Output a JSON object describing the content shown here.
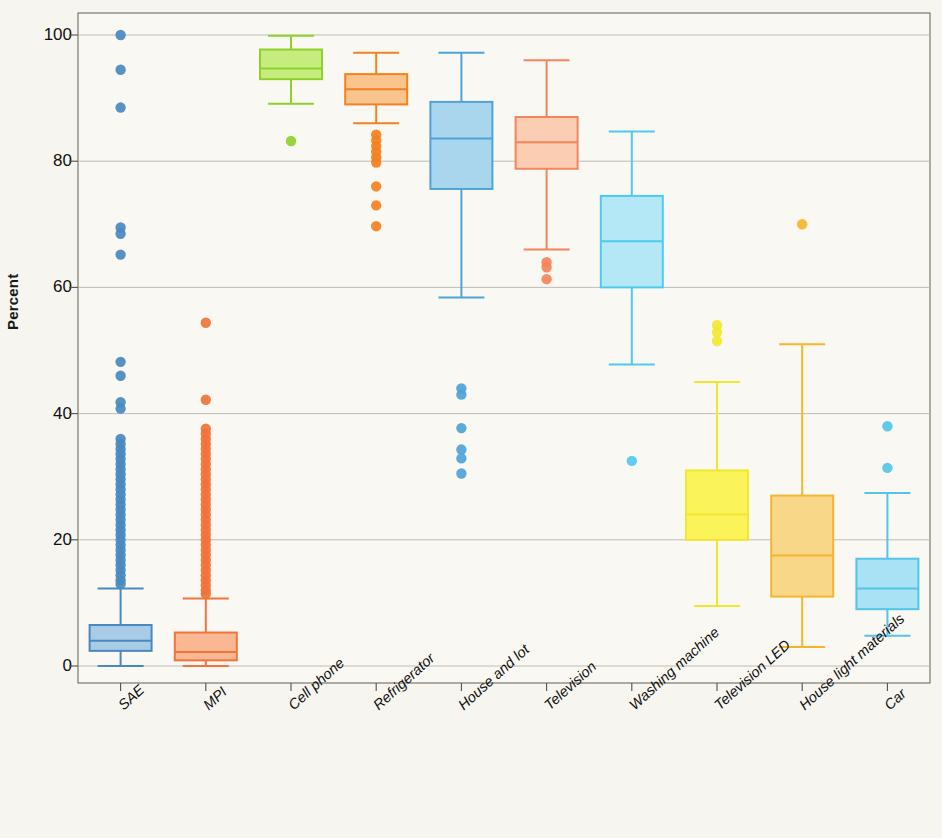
{
  "chart_data": {
    "type": "box",
    "title": "",
    "xlabel": "",
    "ylabel": "Percent",
    "ylim": [
      -6,
      106
    ],
    "yticks": [
      0,
      20,
      40,
      60,
      80,
      100
    ],
    "ytick_labels": [
      "0",
      "20",
      "40",
      "60",
      "80",
      "100"
    ],
    "grid": true,
    "grid_axis": "y",
    "legend": "none",
    "background": "#f6f5f0",
    "plot_background": "#faf8f3",
    "categories": [
      "SAE",
      "MPI",
      "Cell phone",
      "Refrigerator",
      "House and lot",
      "Television",
      "Washing machine",
      "Television LED",
      "House light materials",
      "Car"
    ],
    "boxes": [
      {
        "name": "SAE",
        "color": "#4a89c0",
        "fill": "#a8cbe6",
        "whisker_low": 0.0,
        "q1": 2.4,
        "median": 4.0,
        "q3": 6.5,
        "whisker_high": 12.3,
        "outliers": [
          100.0,
          94.5,
          88.5,
          69.5,
          68.5,
          65.2,
          48.2,
          46.0,
          41.8,
          40.8,
          36.0,
          35.2,
          34.4,
          33.6,
          32.8,
          32.0,
          31.2,
          30.4,
          29.6,
          28.8,
          28.0,
          27.2,
          26.4,
          25.6,
          24.8,
          24.0,
          23.2,
          22.4,
          21.6,
          20.8,
          20.0,
          19.2,
          18.4,
          17.6,
          16.8,
          16.0,
          15.2,
          14.4,
          13.6,
          13.0
        ]
      },
      {
        "name": "MPI",
        "color": "#f0743c",
        "fill": "#f9b893",
        "whisker_low": 0.0,
        "q1": 0.9,
        "median": 2.2,
        "q3": 5.3,
        "whisker_high": 10.7,
        "outliers": [
          54.4,
          42.2,
          37.6,
          36.8,
          36.0,
          35.2,
          34.4,
          33.6,
          32.8,
          32.0,
          31.2,
          30.4,
          29.6,
          28.8,
          28.0,
          27.2,
          26.4,
          25.6,
          24.8,
          24.0,
          23.2,
          22.4,
          21.6,
          20.8,
          20.0,
          19.2,
          18.4,
          17.6,
          16.8,
          16.0,
          15.2,
          14.4,
          13.6,
          12.8,
          12.0,
          11.4
        ]
      },
      {
        "name": "Cell phone",
        "color": "#8cd22a",
        "fill": "#c6ec7e",
        "whisker_low": 89.1,
        "q1": 93.0,
        "median": 94.7,
        "q3": 97.7,
        "whisker_high": 99.9,
        "outliers": [
          83.2
        ]
      },
      {
        "name": "Refrigerator",
        "color": "#f4801f",
        "fill": "#fac48e",
        "whisker_low": 86.0,
        "q1": 89.0,
        "median": 91.4,
        "q3": 93.8,
        "whisker_high": 97.2,
        "outliers": [
          84.2,
          83.3,
          82.4,
          81.5,
          80.6,
          79.8,
          76.0,
          73.0,
          69.7
        ]
      },
      {
        "name": "House and lot",
        "color": "#4ea3d8",
        "fill": "#a9d6ed",
        "whisker_low": 58.4,
        "q1": 75.6,
        "median": 83.6,
        "q3": 89.4,
        "whisker_high": 97.2,
        "outliers": [
          44.0,
          43.0,
          37.7,
          34.3,
          32.9,
          30.5
        ]
      },
      {
        "name": "Television",
        "color": "#f4845a",
        "fill": "#fbcdb3",
        "whisker_low": 66.0,
        "q1": 78.8,
        "median": 83.0,
        "q3": 87.0,
        "whisker_high": 96.0,
        "outliers": [
          64.0,
          63.2,
          61.3
        ]
      },
      {
        "name": "Washing machine",
        "color": "#4ecaf0",
        "fill": "#b4e8f7",
        "whisker_low": 47.8,
        "q1": 60.0,
        "median": 67.3,
        "q3": 74.5,
        "whisker_high": 84.7,
        "outliers": [
          32.5
        ]
      },
      {
        "name": "Television LED",
        "color": "#f2e730",
        "fill": "#faf35a",
        "whisker_low": 9.5,
        "q1": 20.0,
        "median": 24.0,
        "q3": 31.0,
        "whisker_high": 45.0,
        "outliers": [
          54.0,
          52.9,
          51.5
        ]
      },
      {
        "name": "House light materials",
        "color": "#f5b52c",
        "fill": "#f8d888",
        "whisker_low": 3.0,
        "q1": 11.0,
        "median": 17.5,
        "q3": 27.0,
        "whisker_high": 51.0,
        "outliers": [
          70.0
        ]
      },
      {
        "name": "Car",
        "color": "#54c4e8",
        "fill": "#a9e2f4",
        "whisker_low": 4.8,
        "q1": 9.0,
        "median": 12.3,
        "q3": 17.0,
        "whisker_high": 27.4,
        "outliers": [
          38.0,
          31.4
        ]
      }
    ]
  }
}
